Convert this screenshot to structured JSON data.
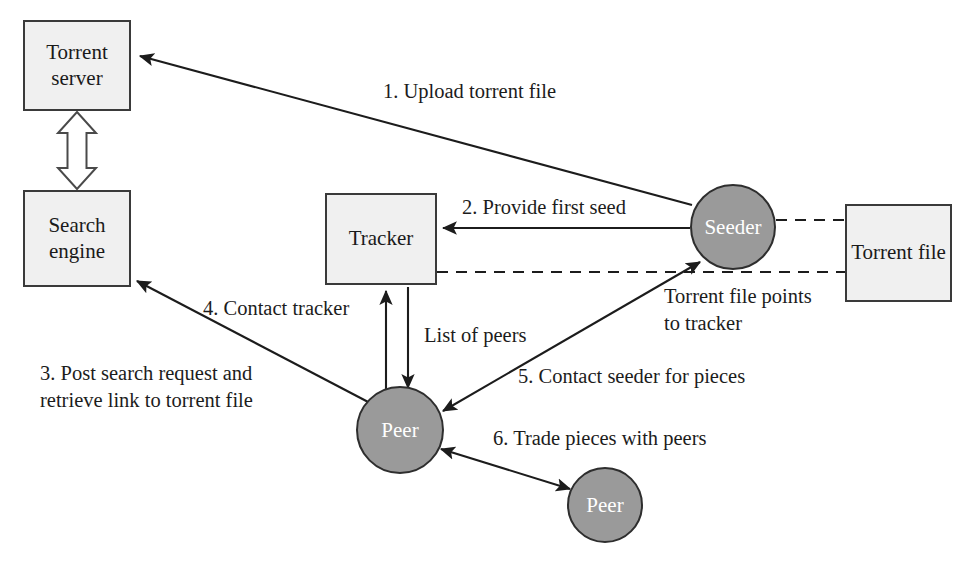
{
  "diagram": {
    "colors": {
      "box_fill": "#f0f0f0",
      "box_stroke": "#3a3a3a",
      "circle_fill": "#9a9a9a",
      "circle_stroke": "#2e2e2e",
      "line": "#1c1c1c",
      "text": "#1a1a1a",
      "circle_text": "#ffffff",
      "background": "#ffffff"
    },
    "nodes": [
      {
        "id": "torrent-server",
        "shape": "box",
        "label": "Torrent\nserver",
        "x": 23,
        "y": 20,
        "w": 108,
        "h": 91
      },
      {
        "id": "search-engine",
        "shape": "box",
        "label": "Search\nengine",
        "x": 23,
        "y": 190,
        "w": 108,
        "h": 97
      },
      {
        "id": "tracker",
        "shape": "box",
        "label": "Tracker",
        "x": 325,
        "y": 193,
        "w": 112,
        "h": 92
      },
      {
        "id": "torrent-file",
        "shape": "box",
        "label": "Torrent\nfile",
        "x": 845,
        "y": 204,
        "w": 107,
        "h": 98
      },
      {
        "id": "seeder",
        "shape": "circle",
        "label": "Seeder",
        "cx": 733,
        "cy": 227,
        "r": 43
      },
      {
        "id": "peer-main",
        "shape": "circle",
        "label": "Peer",
        "cx": 400,
        "cy": 430,
        "r": 44
      },
      {
        "id": "peer-second",
        "shape": "circle",
        "label": "Peer",
        "cx": 605,
        "cy": 505,
        "r": 38
      }
    ],
    "edge_labels": [
      {
        "id": "step-1",
        "text": "1. Upload torrent file",
        "x": 383,
        "y": 78,
        "align": "left"
      },
      {
        "id": "step-2",
        "text": "2. Provide first seed",
        "x": 462,
        "y": 194,
        "align": "left"
      },
      {
        "id": "step-3",
        "text": "3. Post search request and\nretrieve link to torrent file",
        "x": 40,
        "y": 360,
        "align": "left"
      },
      {
        "id": "step-4",
        "text": "4. Contact tracker",
        "x": 203,
        "y": 295,
        "align": "left"
      },
      {
        "id": "step-5",
        "text": "5. Contact seeder for pieces",
        "x": 518,
        "y": 363,
        "align": "left"
      },
      {
        "id": "step-6",
        "text": "6. Trade pieces with peers",
        "x": 493,
        "y": 425,
        "align": "left"
      },
      {
        "id": "list-of-peers",
        "text": "List of peers",
        "x": 424,
        "y": 322,
        "align": "left"
      },
      {
        "id": "torrent-file-points",
        "text": "Torrent file points\nto tracker",
        "x": 664,
        "y": 283,
        "align": "left"
      }
    ],
    "connections": [
      {
        "id": "seeder-to-torrent-server",
        "from": "seeder",
        "to": "torrent-server",
        "style": "solid",
        "arrows": "end",
        "label_ref": "step-1"
      },
      {
        "id": "server-engine-link",
        "from": "torrent-server",
        "to": "search-engine",
        "style": "block",
        "arrows": "both",
        "label_ref": null
      },
      {
        "id": "seeder-to-tracker",
        "from": "seeder",
        "to": "tracker",
        "style": "solid",
        "arrows": "end",
        "label_ref": "step-2"
      },
      {
        "id": "peer-to-search-engine",
        "from": "peer-main",
        "to": "search-engine",
        "style": "solid",
        "arrows": "end",
        "label_ref": "step-3"
      },
      {
        "id": "peer-to-tracker",
        "from": "peer-main",
        "to": "tracker",
        "style": "solid",
        "arrows": "end",
        "label_ref": "step-4"
      },
      {
        "id": "tracker-to-peer",
        "from": "tracker",
        "to": "peer-main",
        "style": "solid",
        "arrows": "end",
        "label_ref": "list-of-peers"
      },
      {
        "id": "peer-to-seeder",
        "from": "peer-main",
        "to": "seeder",
        "style": "solid",
        "arrows": "both",
        "label_ref": "step-5"
      },
      {
        "id": "peer-to-peer",
        "from": "peer-main",
        "to": "peer-second",
        "style": "solid",
        "arrows": "both",
        "label_ref": "step-6"
      },
      {
        "id": "seeder-to-torrent-file",
        "from": "seeder",
        "to": "torrent-file",
        "style": "dashed",
        "arrows": "none",
        "label_ref": null
      },
      {
        "id": "tracker-to-torrent-file",
        "from": "tracker",
        "to": "torrent-file",
        "style": "dashed",
        "arrows": "none",
        "label_ref": "torrent-file-points"
      }
    ]
  }
}
